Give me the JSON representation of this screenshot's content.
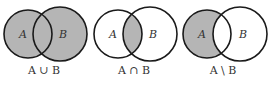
{
  "colors": {
    "fill": "#b5b5b5",
    "stroke": "#1a1a1a",
    "background": "#ffffff",
    "text": "#333333"
  },
  "diagrams": [
    {
      "operation": "union",
      "set_a_label": "A",
      "set_b_label": "B",
      "caption": "A ∪ B",
      "shaded_region": "A and B entirely"
    },
    {
      "operation": "intersection",
      "set_a_label": "A",
      "set_b_label": "B",
      "caption": "A ∩ B",
      "shaded_region": "overlap of A and B"
    },
    {
      "operation": "difference",
      "set_a_label": "A",
      "set_b_label": "B",
      "caption": "A \\ B",
      "shaded_region": "A excluding B"
    }
  ]
}
